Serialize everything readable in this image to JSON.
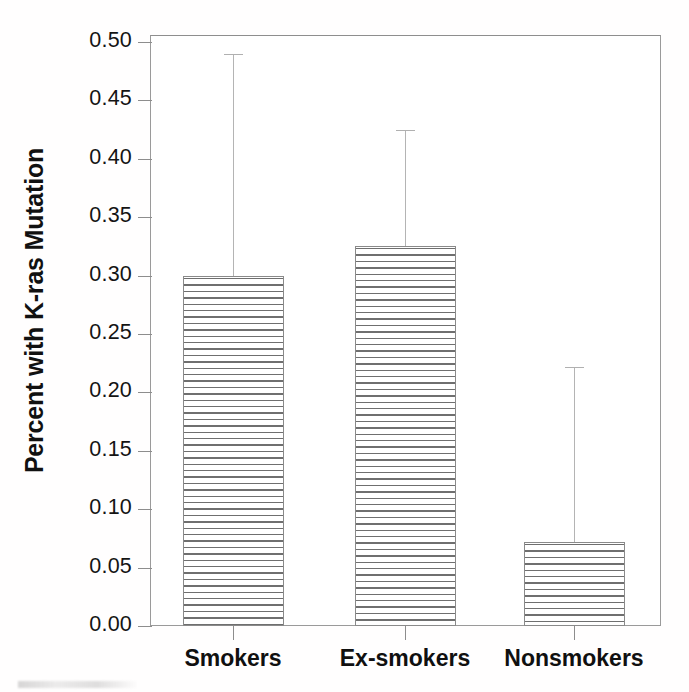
{
  "chart_data": {
    "type": "bar",
    "title": "",
    "subtitle": "",
    "xlabel": "",
    "ylabel": "Percent with K-ras Mutation",
    "categories": [
      "Smokers",
      "Ex-smokers",
      "Nonsmokers"
    ],
    "values": [
      0.3,
      0.325,
      0.072
    ],
    "error_upper": [
      0.49,
      0.425,
      0.222
    ],
    "error_bars": "upper-only",
    "ylim": [
      0.0,
      0.5
    ],
    "ytick_labels": [
      "0.00",
      "0.05",
      "0.10",
      "0.15",
      "0.20",
      "0.25",
      "0.30",
      "0.35",
      "0.40",
      "0.45",
      "0.50"
    ],
    "ytick_values": [
      0.0,
      0.05,
      0.1,
      0.15,
      0.2,
      0.25,
      0.3,
      0.35,
      0.4,
      0.45,
      0.5
    ],
    "grid": false,
    "legend": false,
    "legend_position": "none",
    "bar_fill": "horizontal-hatch",
    "bar_color": "#ffffff",
    "bar_edge_color": "#8a8a8a",
    "hatch_color": "#6f6f6f",
    "error_bar_color": "#b0b0b0",
    "axis_color": "#8d8d8d"
  },
  "figure": {
    "background": "#ffffff",
    "caption": ""
  }
}
